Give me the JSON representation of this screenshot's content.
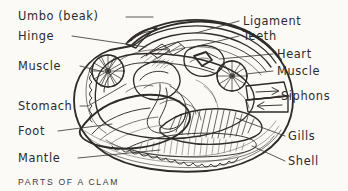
{
  "figure": {
    "title": "PARTS OF A CLAM",
    "medium": "pencil-and-ink anatomical drawing",
    "background_color": "#fbfaf7",
    "ink_color": "#2e2b28",
    "label_color": "#2b2b2b"
  },
  "caption": {
    "text": "PARTS OF A CLAM"
  },
  "labels": {
    "left": [
      {
        "id": "umbo",
        "text": "Umbo (beak)",
        "x": 18,
        "y": 20
      },
      {
        "id": "hinge",
        "text": "Hinge",
        "x": 18,
        "y": 40
      },
      {
        "id": "muscle",
        "text": "Muscle",
        "x": 18,
        "y": 70
      },
      {
        "id": "stomach",
        "text": "Stomach",
        "x": 18,
        "y": 110
      },
      {
        "id": "foot",
        "text": "Foot",
        "x": 18,
        "y": 135
      },
      {
        "id": "mantle",
        "text": "Mantle",
        "x": 18,
        "y": 162
      }
    ],
    "right": [
      {
        "id": "ligament",
        "text": "Ligament",
        "x": 243,
        "y": 25
      },
      {
        "id": "teeth",
        "text": "Teeth",
        "x": 243,
        "y": 40
      },
      {
        "id": "heart",
        "text": "Heart",
        "x": 277,
        "y": 58
      },
      {
        "id": "muscle_r",
        "text": "Muscle",
        "x": 277,
        "y": 75
      },
      {
        "id": "siphons",
        "text": "Siphons",
        "x": 281,
        "y": 100
      },
      {
        "id": "gills",
        "text": "Gills",
        "x": 288,
        "y": 140
      },
      {
        "id": "shell",
        "text": "Shell",
        "x": 288,
        "y": 165
      }
    ]
  },
  "annotations": {
    "siphon_arrows": [
      {
        "id": "incurrent-arrow",
        "direction": "right"
      },
      {
        "id": "excurrent-arrow",
        "direction": "left"
      }
    ]
  }
}
